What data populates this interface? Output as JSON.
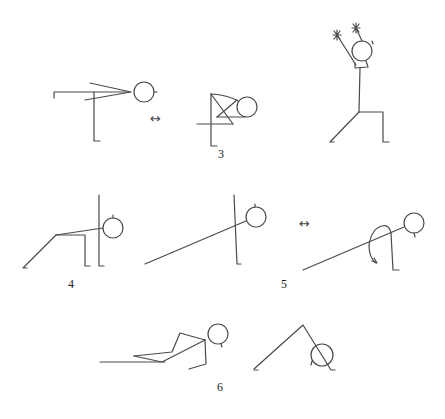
{
  "diagram": {
    "labels": {
      "group3": "3",
      "group4": "4",
      "group5": "5",
      "group6": "6"
    },
    "arrows": {
      "alternate_a": "↔",
      "alternate_b": "↔"
    },
    "figures": [
      {
        "group": "3",
        "pose": "standing-balance-leg-extended-arms-forward"
      },
      {
        "group": "3",
        "pose": "folded-balance-alternate"
      },
      {
        "group": "3",
        "pose": "lunge-arms-raised"
      },
      {
        "group": "4",
        "pose": "wall-supported-leg-extension"
      },
      {
        "group": "5",
        "pose": "wall-lean-stretch"
      },
      {
        "group": "5",
        "pose": "kneeling-lean-alternate"
      },
      {
        "group": "6",
        "pose": "reclined-twist"
      },
      {
        "group": "6",
        "pose": "downward-fold"
      }
    ]
  }
}
